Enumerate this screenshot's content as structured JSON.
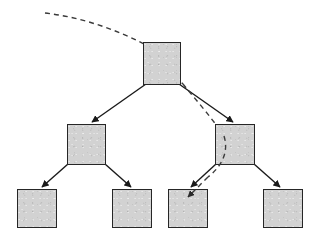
{
  "figure": {
    "type": "diagram",
    "width": 320,
    "height": 240,
    "background_color": "#ffffff"
  },
  "style": {
    "node_fill": "#d2d2d2",
    "node_stroke": "#262626",
    "node_stroke_width": 1.5,
    "edge_color": "#1a1a1a",
    "edge_width": 1.4,
    "dashed_color": "#3a3a3a",
    "dashed_width": 1.4,
    "dash_pattern": "5,4"
  },
  "nodes": [
    {
      "id": "root",
      "label": "",
      "role": "root",
      "level": 0,
      "x": 143,
      "y": 42,
      "w": 38,
      "h": 43
    },
    {
      "id": "mid-l",
      "label": "",
      "role": "branch",
      "level": 1,
      "x": 67,
      "y": 124,
      "w": 39,
      "h": 41
    },
    {
      "id": "mid-r",
      "label": "",
      "role": "branch",
      "level": 1,
      "x": 215,
      "y": 124,
      "w": 40,
      "h": 41
    },
    {
      "id": "leaf-1",
      "label": "",
      "role": "leaf",
      "level": 2,
      "x": 17,
      "y": 189,
      "w": 40,
      "h": 39
    },
    {
      "id": "leaf-2",
      "label": "",
      "role": "leaf",
      "level": 2,
      "x": 112,
      "y": 189,
      "w": 40,
      "h": 39
    },
    {
      "id": "leaf-3",
      "label": "",
      "role": "leaf",
      "level": 2,
      "x": 168,
      "y": 189,
      "w": 40,
      "h": 39
    },
    {
      "id": "leaf-4",
      "label": "",
      "role": "leaf",
      "level": 2,
      "x": 263,
      "y": 189,
      "w": 40,
      "h": 39
    }
  ],
  "edges": [
    {
      "id": "edge-root-midl",
      "from": "root",
      "to": "mid-l",
      "style": "solid",
      "arrows": "both",
      "x1": 146,
      "y1": 84,
      "x2": 92,
      "y2": 122
    },
    {
      "id": "edge-root-midr",
      "from": "root",
      "to": "mid-r",
      "style": "solid",
      "arrows": "both",
      "x1": 179,
      "y1": 84,
      "x2": 233,
      "y2": 122
    },
    {
      "id": "edge-midl-leaf1",
      "from": "mid-l",
      "to": "leaf-1",
      "style": "solid",
      "arrows": "both",
      "x1": 68,
      "y1": 164,
      "x2": 42,
      "y2": 187
    },
    {
      "id": "edge-midl-leaf2",
      "from": "mid-l",
      "to": "leaf-2",
      "style": "solid",
      "arrows": "both",
      "x1": 105,
      "y1": 164,
      "x2": 131,
      "y2": 187
    },
    {
      "id": "edge-midr-leaf3",
      "from": "mid-r",
      "to": "leaf-3",
      "style": "solid",
      "arrows": "both",
      "x1": 216,
      "y1": 164,
      "x2": 191,
      "y2": 187
    },
    {
      "id": "edge-midr-leaf4",
      "from": "mid-r",
      "to": "leaf-4",
      "style": "solid",
      "arrows": "both",
      "x1": 254,
      "y1": 164,
      "x2": 280,
      "y2": 187
    }
  ],
  "path": {
    "id": "traversal-path",
    "style": "dashed",
    "arrow_end": "leaf-3",
    "description": "dashed curve entering from upper-left, passing through root and right branch, terminating inside third leaf",
    "segments": [
      {
        "id": "dash-entry",
        "d": "M 45,13 C 80,17 115,29 144,44"
      },
      {
        "id": "dash-through-root",
        "d": "M 144,44 L 183,84"
      },
      {
        "id": "dash-right-branch",
        "d": "M 183,84 C 196,100 212,118 224,136"
      },
      {
        "id": "dash-into-leaf",
        "d": "M 224,136 C 229,152 222,166 208,177"
      },
      {
        "id": "dash-arrow-tip",
        "d": "M 208,177 L 186,199"
      }
    ]
  }
}
